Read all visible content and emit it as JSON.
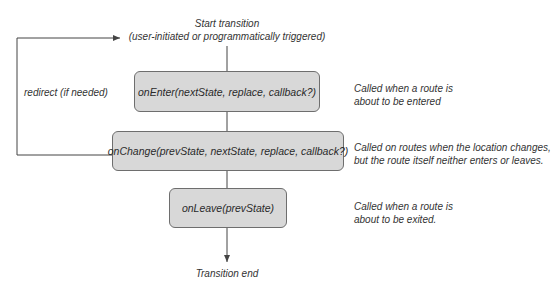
{
  "diagram": {
    "start": {
      "title": "Start transition",
      "subtitle": "(user-initiated or programmatically triggered)"
    },
    "end": {
      "label": "Transition end"
    },
    "redirect": {
      "label": "redirect (if needed)"
    },
    "hooks": [
      {
        "signature": "onEnter(nextState, replace, callback?)",
        "description_line1": "Called when a route is",
        "description_line2": "about to be entered"
      },
      {
        "signature": "onChange(prevState, nextState, replace, callback?)",
        "description_line1": "Called on routes when the location changes,",
        "description_line2": "but the route itself neither enters or leaves."
      },
      {
        "signature": "onLeave(prevState)",
        "description_line1": "Called when a route is",
        "description_line2": "about to be exited."
      }
    ],
    "colors": {
      "box_fill": "#d8d8d8",
      "box_border": "#6e6e6e",
      "line": "#444444",
      "text": "#333333"
    }
  }
}
